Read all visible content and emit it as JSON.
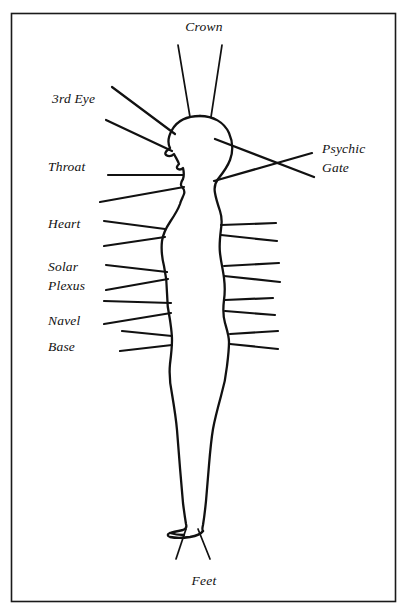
{
  "diagram": {
    "background_color": "#ffffff",
    "ink_color": "#111111",
    "frame": {
      "name": "border-frame",
      "x": 11,
      "y": 13,
      "width": 385,
      "height": 589
    },
    "labels": {
      "crown": "Crown",
      "third_eye": "3rd Eye",
      "throat": "Throat",
      "heart": "Heart",
      "solar_plexus_line1": "Solar",
      "solar_plexus_line2": "Plexus",
      "navel": "Navel",
      "base": "Base",
      "feet": "Feet",
      "psychic_gate_line1": "Psychic",
      "psychic_gate_line2": "Gate"
    },
    "label_positions": {
      "crown": {
        "x": 204,
        "y": 31,
        "anchor": "middle"
      },
      "third_eye": {
        "x": 52,
        "y": 103,
        "anchor": "start"
      },
      "throat": {
        "x": 48,
        "y": 171,
        "anchor": "start"
      },
      "heart": {
        "x": 48,
        "y": 228,
        "anchor": "start"
      },
      "solar_plexus_line1": {
        "x": 48,
        "y": 271,
        "anchor": "start"
      },
      "solar_plexus_line2": {
        "x": 48,
        "y": 289,
        "anchor": "start"
      },
      "navel": {
        "x": 48,
        "y": 325,
        "anchor": "start"
      },
      "base": {
        "x": 48,
        "y": 351,
        "anchor": "start"
      },
      "feet": {
        "x": 204,
        "y": 585,
        "anchor": "middle"
      },
      "psychic_gate_line1": {
        "x": 322,
        "y": 153,
        "anchor": "start"
      },
      "psychic_gate_line2": {
        "x": 322,
        "y": 171,
        "anchor": "start"
      }
    },
    "chakra_centers": [
      "Crown",
      "3rd Eye",
      "Throat",
      "Heart",
      "Solar Plexus",
      "Navel",
      "Base",
      "Feet",
      "Psychic Gate"
    ],
    "rays": {
      "crown": [
        {
          "x1": 190,
          "y1": 117,
          "x2": 178,
          "y2": 45
        },
        {
          "x1": 211,
          "y1": 117,
          "x2": 222,
          "y2": 45
        }
      ],
      "third_eye": [
        {
          "x1": 175,
          "y1": 134,
          "x2": 112,
          "y2": 87
        },
        {
          "x1": 172,
          "y1": 150,
          "x2": 106,
          "y2": 120
        }
      ],
      "throat": [
        {
          "x1": 183,
          "y1": 174,
          "x2": 108,
          "y2": 174
        },
        {
          "x1": 184,
          "y1": 186,
          "x2": 100,
          "y2": 201
        }
      ],
      "heart": [
        {
          "x1": 164,
          "y1": 229,
          "x2": 104,
          "y2": 221
        },
        {
          "x1": 164,
          "y1": 236,
          "x2": 104,
          "y2": 245
        }
      ],
      "solar_plexus": [
        {
          "x1": 167,
          "y1": 272,
          "x2": 106,
          "y2": 265
        },
        {
          "x1": 168,
          "y1": 278,
          "x2": 106,
          "y2": 290
        }
      ],
      "navel": [
        {
          "x1": 171,
          "y1": 303,
          "x2": 104,
          "y2": 301
        },
        {
          "x1": 171,
          "y1": 312,
          "x2": 104,
          "y2": 323
        }
      ],
      "base": [
        {
          "x1": 172,
          "y1": 336,
          "x2": 122,
          "y2": 331
        },
        {
          "x1": 172,
          "y1": 344,
          "x2": 120,
          "y2": 350
        }
      ],
      "feet": [
        {
          "x1": 186,
          "y1": 528,
          "x2": 176,
          "y2": 557
        },
        {
          "x1": 198,
          "y1": 528,
          "x2": 210,
          "y2": 557
        }
      ],
      "psychic_gate": [
        {
          "x1": 215,
          "y1": 138,
          "x2": 314,
          "y2": 176
        },
        {
          "x1": 214,
          "y1": 180,
          "x2": 312,
          "y2": 152
        }
      ],
      "right_side": [
        {
          "x1": 222,
          "y1": 225,
          "x2": 276,
          "y2": 223
        },
        {
          "x1": 222,
          "y1": 235,
          "x2": 277,
          "y2": 240
        },
        {
          "x1": 226,
          "y1": 266,
          "x2": 279,
          "y2": 263
        },
        {
          "x1": 227,
          "y1": 275,
          "x2": 280,
          "y2": 281
        },
        {
          "x1": 228,
          "y1": 300,
          "x2": 273,
          "y2": 298
        },
        {
          "x1": 228,
          "y1": 310,
          "x2": 275,
          "y2": 314
        },
        {
          "x1": 234,
          "y1": 334,
          "x2": 278,
          "y2": 331
        },
        {
          "x1": 234,
          "y1": 343,
          "x2": 278,
          "y2": 348
        }
      ]
    }
  }
}
